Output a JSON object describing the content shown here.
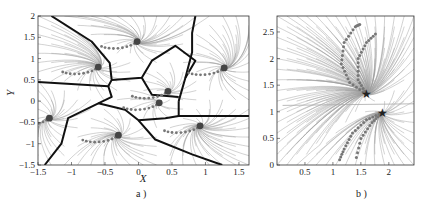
{
  "chart_data": [
    {
      "type": "scatter",
      "panel": "a)",
      "title": "",
      "xlabel": "X",
      "ylabel": "Y",
      "xlim": [
        -1.5,
        1.65
      ],
      "ylim": [
        -1.5,
        2
      ],
      "xticks": [
        "-1.5",
        "-1",
        "-0.5",
        "0",
        "0.5",
        "1",
        "1.5"
      ],
      "yticks": [
        "-1.5",
        "-1",
        "-0.5",
        "0",
        "0.5",
        "1",
        "1.5",
        "2"
      ],
      "grid": false,
      "legend": "none",
      "background": "streamlines (vector field)",
      "attractors": [
        {
          "x": -0.6,
          "y": 0.8
        },
        {
          "x": -0.02,
          "y": 1.4
        },
        {
          "x": 1.28,
          "y": 0.78
        },
        {
          "x": 0.44,
          "y": 0.23
        },
        {
          "x": 0.31,
          "y": -0.04
        },
        {
          "x": -1.33,
          "y": -0.4
        },
        {
          "x": -0.3,
          "y": -0.8
        },
        {
          "x": 0.92,
          "y": -0.58
        }
      ],
      "region_boundaries": "thick black lines partitioning the plane into 8 basins"
    },
    {
      "type": "scatter",
      "panel": "b)",
      "title": "",
      "xlabel": "",
      "ylabel": "",
      "xlim": [
        0,
        2.45
      ],
      "ylim": [
        0,
        2.8
      ],
      "xticks": [
        "0.5",
        "1",
        "1.5",
        "2"
      ],
      "yticks": [
        "0",
        "0.5",
        "1",
        "1.5",
        "2",
        "2.5"
      ],
      "grid": false,
      "legend": "none",
      "background": "streamlines (vector field)",
      "targets": [
        {
          "x": 1.6,
          "y": 1.33,
          "marker": "star"
        },
        {
          "x": 1.88,
          "y": 0.98,
          "marker": "star"
        }
      ],
      "trajectories": "asterisk-marked demonstration paths converging to star targets"
    }
  ],
  "captions": {
    "a": "a )",
    "b": "b )"
  }
}
